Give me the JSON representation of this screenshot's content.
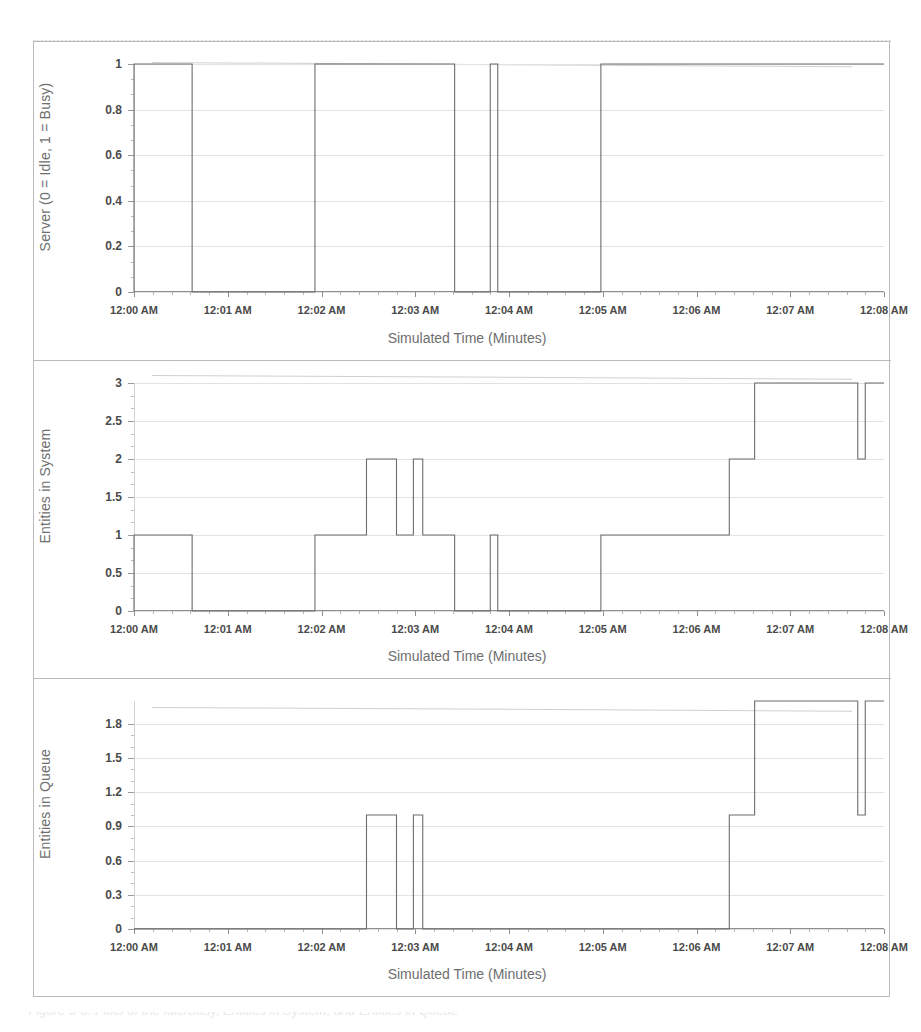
{
  "figure": {
    "caption": "Figure 5-3. Plots of the Idle/Busy, Entities in System, and Entities in Queue"
  },
  "chart_data": [
    {
      "id": "server-status",
      "type": "line",
      "step": true,
      "title": "",
      "xlabel": "Simulated Time (Minutes)",
      "ylabel": "Server (0 = Idle, 1 = Busy)",
      "xlim": [
        0,
        8
      ],
      "ylim": [
        0,
        1
      ],
      "grid": true,
      "legend": "none",
      "xticks": [
        0,
        1,
        2,
        3,
        4,
        5,
        6,
        7,
        8
      ],
      "xticklabels": [
        "12:00 AM",
        "12:01 AM",
        "12:02 AM",
        "12:03 AM",
        "12:04 AM",
        "12:05 AM",
        "12:06 AM",
        "12:07 AM",
        "12:08 AM"
      ],
      "yticks": [
        0,
        0.2,
        0.4,
        0.6,
        0.8,
        1
      ],
      "yticklabels": [
        "0",
        "0.2",
        "0.4",
        "0.6",
        "0.8",
        "1"
      ],
      "x": [
        0.0,
        0.0,
        0.62,
        0.62,
        1.93,
        1.93,
        3.42,
        3.42,
        3.8,
        3.8,
        3.88,
        3.88,
        4.98,
        4.98,
        8.0
      ],
      "y": [
        0,
        1,
        1,
        0,
        0,
        1,
        1,
        0,
        0,
        1,
        1,
        0,
        0,
        1,
        1
      ]
    },
    {
      "id": "entities-in-system",
      "type": "line",
      "step": true,
      "title": "",
      "xlabel": "Simulated Time (Minutes)",
      "ylabel": "Entities in System",
      "xlim": [
        0,
        8
      ],
      "ylim": [
        0,
        3
      ],
      "grid": true,
      "legend": "none",
      "xticks": [
        0,
        1,
        2,
        3,
        4,
        5,
        6,
        7,
        8
      ],
      "xticklabels": [
        "12:00 AM",
        "12:01 AM",
        "12:02 AM",
        "12:03 AM",
        "12:04 AM",
        "12:05 AM",
        "12:06 AM",
        "12:07 AM",
        "12:08 AM"
      ],
      "yticks": [
        0,
        0.5,
        1,
        1.5,
        2,
        2.5,
        3
      ],
      "yticklabels": [
        "0",
        "0.5",
        "1",
        "1.5",
        "2",
        "2.5",
        "3"
      ],
      "x": [
        0.0,
        0.0,
        0.62,
        0.62,
        1.93,
        1.93,
        2.48,
        2.48,
        2.8,
        2.8,
        2.98,
        2.98,
        3.08,
        3.08,
        3.42,
        3.42,
        3.8,
        3.8,
        3.88,
        3.88,
        4.98,
        4.98,
        6.35,
        6.35,
        6.62,
        6.62,
        7.72,
        7.72,
        7.8,
        7.8,
        8.0
      ],
      "y": [
        0,
        1,
        1,
        0,
        0,
        1,
        1,
        2,
        2,
        1,
        1,
        2,
        2,
        1,
        1,
        0,
        0,
        1,
        1,
        0,
        0,
        1,
        1,
        2,
        2,
        3,
        3,
        2,
        2,
        3,
        3
      ]
    },
    {
      "id": "entities-in-queue",
      "type": "line",
      "step": true,
      "title": "",
      "xlabel": "Simulated Time (Minutes)",
      "ylabel": "Entities in Queue",
      "xlim": [
        0,
        8
      ],
      "ylim": [
        0,
        2
      ],
      "grid": true,
      "legend": "none",
      "xticks": [
        0,
        1,
        2,
        3,
        4,
        5,
        6,
        7,
        8
      ],
      "xticklabels": [
        "12:00 AM",
        "12:01 AM",
        "12:02 AM",
        "12:03 AM",
        "12:04 AM",
        "12:05 AM",
        "12:06 AM",
        "12:07 AM",
        "12:08 AM"
      ],
      "yticks": [
        0,
        0.3,
        0.6,
        0.9,
        1.2,
        1.5,
        1.8
      ],
      "yticklabels": [
        "0",
        "0.3",
        "0.6",
        "0.9",
        "1.2",
        "1.5",
        "1.8"
      ],
      "x": [
        0.0,
        2.48,
        2.48,
        2.8,
        2.8,
        2.98,
        2.98,
        3.08,
        3.08,
        6.35,
        6.35,
        6.62,
        6.62,
        7.72,
        7.72,
        7.8,
        7.8,
        8.0
      ],
      "y": [
        0,
        0,
        1,
        1,
        0,
        0,
        1,
        1,
        0,
        0,
        1,
        1,
        2,
        2,
        1,
        1,
        2,
        2
      ]
    }
  ]
}
